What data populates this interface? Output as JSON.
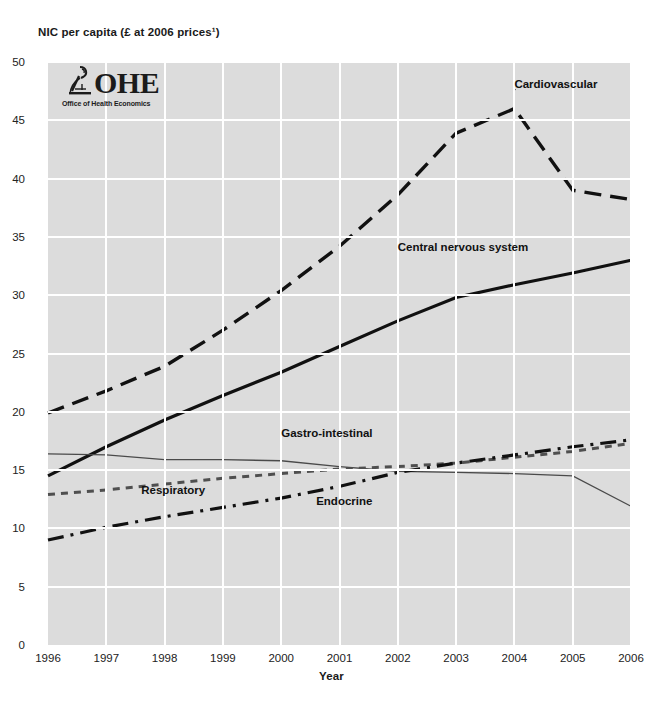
{
  "logo": {
    "wordmark": "OHE",
    "subtitle": "Office of Health Economics",
    "mark_icon": "microscope-icon"
  },
  "chart_data": {
    "type": "line",
    "title": "",
    "ylabel": "NIC per capita (£ at 2006 prices¹)",
    "xlabel": "Year",
    "categories": [
      1996,
      1997,
      1998,
      1999,
      2000,
      2001,
      2002,
      2003,
      2004,
      2005,
      2006
    ],
    "xtick_labels": [
      "1996",
      "1997",
      "1998",
      "1999",
      "2000",
      "2001",
      "2002",
      "2003",
      "2004",
      "2005",
      "2006"
    ],
    "ytick_labels": [
      "0",
      "5",
      "10",
      "15",
      "20",
      "25",
      "30",
      "35",
      "40",
      "45",
      "50"
    ],
    "ylim": [
      0,
      50
    ],
    "xlim": [
      1996,
      2006
    ],
    "ytick_step": 5,
    "grid": true,
    "legend": "inline-annotations",
    "plot_background": "#dcdcdc",
    "gridline_color": "#ffffff",
    "series": [
      {
        "name": "Cardiovascular",
        "style": "dashed",
        "color": "#111111",
        "width": 3.4,
        "label_x": 2004.0,
        "label_y": 47.9,
        "leader_to_x": 2003.7,
        "leader_to_y": 45.3,
        "values": [
          19.9,
          21.8,
          23.9,
          27.0,
          30.4,
          34.2,
          38.6,
          43.9,
          46.0,
          39.0,
          38.2
        ]
      },
      {
        "name": "Central nervous system",
        "style": "solid",
        "color": "#111111",
        "width": 3.2,
        "label_x": 2002.0,
        "label_y": 34.0,
        "leader_to_x": null,
        "leader_to_y": null,
        "values": [
          14.5,
          17.0,
          19.3,
          21.4,
          23.4,
          25.6,
          27.8,
          29.8,
          30.9,
          31.9,
          33.0
        ]
      },
      {
        "name": "Gastro-intestinal",
        "style": "thin-solid",
        "color": "#4a4a4a",
        "width": 1.3,
        "label_x": 2000.0,
        "label_y": 18.0,
        "leader_to_x": null,
        "leader_to_y": null,
        "values": [
          16.4,
          16.3,
          15.9,
          15.9,
          15.8,
          15.3,
          14.9,
          14.8,
          14.7,
          14.5,
          11.9
        ]
      },
      {
        "name": "Respiratory",
        "style": "dotted",
        "color": "#4f4f4f",
        "width": 3.0,
        "label_x": 1997.6,
        "label_y": 13.1,
        "leader_to_x": null,
        "leader_to_y": null,
        "values": [
          12.9,
          13.3,
          13.8,
          14.3,
          14.7,
          15.1,
          15.3,
          15.6,
          16.1,
          16.6,
          17.3
        ]
      },
      {
        "name": "Endocrine",
        "style": "dash-dot",
        "color": "#111111",
        "width": 3.2,
        "label_x": 2000.6,
        "label_y": 12.2,
        "leader_to_x": null,
        "leader_to_y": null,
        "values": [
          9.0,
          10.1,
          11.0,
          11.8,
          12.6,
          13.6,
          14.8,
          15.6,
          16.3,
          17.0,
          17.6
        ]
      }
    ]
  }
}
